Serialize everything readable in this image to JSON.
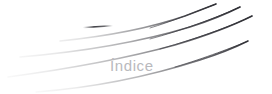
{
  "page": {
    "kind": "decorative-section-header",
    "background_color": "#ffffff",
    "width": 272,
    "height": 94
  },
  "title": {
    "text": "Índice",
    "color": "#b9b9bd",
    "font_size_px": 15,
    "x": 110,
    "y": 58
  },
  "graphic": {
    "name": "swoosh-flourish",
    "stroke_dark_color": "#3a3a40",
    "stroke_mid_color": "#9a9aa0",
    "stroke_light_color": "#e8e8ea",
    "description": "Four tapered swooping curves sweeping from faint lower-left to dark upper-right, plus a short dash accent",
    "strokes": [
      {
        "id": "swoosh-1-top",
        "path": "M 60 41 C 110 36 150 28 185 16 C 198 11 208 7 216 4",
        "width_start": 0.6,
        "width_end": 2.0,
        "opacity_start": 0.05,
        "opacity_end": 1.0
      },
      {
        "id": "swoosh-2-upper-mid",
        "path": "M 20 57 C 80 52 140 42 190 27 C 212 20 228 13 240 7",
        "width_start": 0.6,
        "width_end": 2.2,
        "opacity_start": 0.04,
        "opacity_end": 1.0
      },
      {
        "id": "swoosh-3-lower-mid",
        "path": "M 8 77 C 60 70 120 60 175 45 C 205 36 232 26 252 16",
        "width_start": 0.6,
        "width_end": 2.2,
        "opacity_start": 0.03,
        "opacity_end": 1.0
      },
      {
        "id": "swoosh-4-bottom",
        "path": "M 36 92 C 90 88 150 76 200 60 C 222 53 238 46 248 41",
        "width_start": 0.5,
        "width_end": 1.8,
        "opacity_start": 0.03,
        "opacity_end": 0.95
      }
    ],
    "dash_accent": {
      "id": "dash-accent",
      "path": "M 84 27 L 110 26",
      "color": "#3a3a40",
      "width": 1.4
    }
  }
}
